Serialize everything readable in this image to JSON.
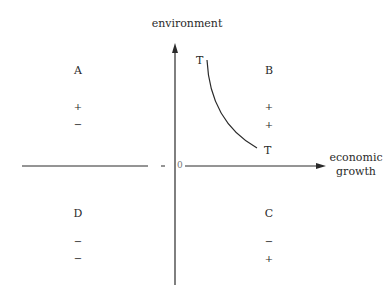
{
  "axes": {
    "y_label": "environment",
    "x_label_line1": "economic",
    "x_label_line2": "growth",
    "origin_label": "0"
  },
  "curve": {
    "label_top": "T",
    "label_bottom": "T"
  },
  "quadrants": {
    "A": {
      "label": "A",
      "sign1": "+",
      "sign2": "−"
    },
    "B": {
      "label": "B",
      "sign1": "+",
      "sign2": "+"
    },
    "C": {
      "label": "C",
      "sign1": "−",
      "sign2": "+"
    },
    "D": {
      "label": "D",
      "sign1": "−",
      "sign2": "−"
    }
  },
  "colors": {
    "line": "#2a2a2a",
    "background": "#ffffff"
  }
}
